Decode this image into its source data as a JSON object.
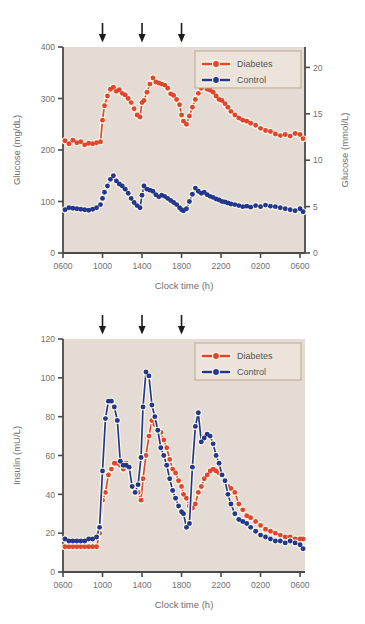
{
  "figure": {
    "panels": [
      "glucose",
      "insulin"
    ],
    "colors": {
      "diabetes": "#e0452f",
      "control": "#24378f",
      "plot_background": "#e4dcd4",
      "axis": "#4a4a48",
      "text": "#6f6f6f",
      "marker_halo": "#fbf7e6",
      "legend_background": "#ece4da",
      "legend_border": "#b9a88d",
      "arrow": "#1b1b1b"
    }
  },
  "chart_data": [
    {
      "type": "line",
      "id": "glucose",
      "title": "",
      "xlabel": "Clock time (h)",
      "ylabel": "Glucose (mg/dL)",
      "ylabel_right": "Glucose (mmol/L)",
      "xtick_labels": [
        "0600",
        "1000",
        "1400",
        "1800",
        "2200",
        "0200",
        "0600"
      ],
      "xticks": [
        6,
        10,
        14,
        18,
        22,
        26,
        30
      ],
      "xlim": [
        6,
        30.5
      ],
      "ylim": [
        0,
        400
      ],
      "yticks": [
        0,
        100,
        200,
        300,
        400
      ],
      "ytick_labels": [
        "0",
        "100",
        "200",
        "300",
        "400"
      ],
      "ylim_right": [
        0,
        22.2
      ],
      "yticks_right": [
        0,
        5,
        10,
        15,
        20
      ],
      "ytick_labels_right": [
        "0",
        "5",
        "10",
        "15",
        "20"
      ],
      "grid": false,
      "legend_position": "top-right",
      "annotations": [
        {
          "type": "arrow",
          "label": "meal",
          "x": 10.0
        },
        {
          "type": "arrow",
          "label": "meal",
          "x": 14.0
        },
        {
          "type": "arrow",
          "label": "meal",
          "x": 18.0
        }
      ],
      "series": [
        {
          "name": "Diabetes",
          "color": "#e0452f",
          "x": [
            6.2,
            6.6,
            7.0,
            7.4,
            7.8,
            8.2,
            8.6,
            9.0,
            9.4,
            9.8,
            10.0,
            10.2,
            10.5,
            10.8,
            11.1,
            11.4,
            11.7,
            12.0,
            12.3,
            12.6,
            12.9,
            13.2,
            13.5,
            13.8,
            14.0,
            14.2,
            14.5,
            14.8,
            15.1,
            15.4,
            15.7,
            16.0,
            16.3,
            16.6,
            16.9,
            17.2,
            17.5,
            17.8,
            18.0,
            18.2,
            18.5,
            18.8,
            19.1,
            19.4,
            19.7,
            20.0,
            20.3,
            20.6,
            20.9,
            21.2,
            21.5,
            21.8,
            22.1,
            22.4,
            22.7,
            23.0,
            23.4,
            23.8,
            24.2,
            24.6,
            25.0,
            25.5,
            26.0,
            26.5,
            27.0,
            27.5,
            28.0,
            28.5,
            29.0,
            29.5,
            30.0,
            30.3
          ],
          "y": [
            218,
            212,
            219,
            214,
            216,
            210,
            213,
            212,
            214,
            216,
            258,
            286,
            305,
            318,
            322,
            314,
            317,
            310,
            307,
            300,
            292,
            280,
            268,
            264,
            292,
            296,
            312,
            328,
            340,
            332,
            330,
            328,
            326,
            320,
            309,
            306,
            298,
            288,
            268,
            256,
            250,
            266,
            283,
            298,
            310,
            320,
            325,
            318,
            316,
            312,
            305,
            298,
            296,
            290,
            283,
            275,
            268,
            262,
            258,
            256,
            252,
            248,
            242,
            238,
            236,
            231,
            228,
            230,
            227,
            232,
            230,
            222
          ]
        },
        {
          "name": "Control",
          "color": "#24378f",
          "x": [
            6.2,
            6.6,
            7.0,
            7.4,
            7.8,
            8.2,
            8.6,
            9.0,
            9.4,
            9.8,
            10.0,
            10.2,
            10.5,
            10.8,
            11.1,
            11.4,
            11.7,
            12.0,
            12.3,
            12.6,
            12.9,
            13.2,
            13.5,
            13.8,
            14.0,
            14.2,
            14.5,
            14.8,
            15.1,
            15.4,
            15.7,
            16.0,
            16.3,
            16.6,
            16.9,
            17.2,
            17.5,
            17.8,
            18.0,
            18.2,
            18.5,
            18.8,
            19.1,
            19.4,
            19.7,
            20.0,
            20.3,
            20.6,
            20.9,
            21.2,
            21.5,
            21.8,
            22.1,
            22.4,
            22.7,
            23.0,
            23.4,
            23.8,
            24.2,
            24.6,
            25.0,
            25.5,
            26.0,
            26.5,
            27.0,
            27.5,
            28.0,
            28.5,
            29.0,
            29.5,
            30.0,
            30.3
          ],
          "y": [
            84,
            88,
            87,
            86,
            85,
            84,
            83,
            85,
            88,
            94,
            106,
            118,
            130,
            143,
            150,
            140,
            134,
            130,
            124,
            116,
            106,
            98,
            92,
            88,
            112,
            130,
            124,
            122,
            120,
            113,
            109,
            112,
            110,
            106,
            102,
            98,
            94,
            88,
            84,
            82,
            86,
            100,
            114,
            126,
            120,
            116,
            118,
            113,
            110,
            108,
            105,
            103,
            100,
            99,
            97,
            95,
            94,
            92,
            90,
            91,
            89,
            92,
            90,
            93,
            91,
            90,
            88,
            86,
            84,
            82,
            86,
            80
          ]
        }
      ]
    },
    {
      "type": "line",
      "id": "insulin",
      "title": "",
      "xlabel": "Clock time (h)",
      "ylabel": "Insulin (mU/L)",
      "xtick_labels": [
        "0600",
        "1000",
        "1400",
        "1800",
        "2200",
        "0200",
        "0600"
      ],
      "xticks": [
        6,
        10,
        14,
        18,
        22,
        26,
        30
      ],
      "xlim": [
        6,
        30.5
      ],
      "ylim": [
        0,
        120
      ],
      "yticks": [
        0,
        20,
        40,
        60,
        80,
        100,
        120
      ],
      "ytick_labels": [
        "0",
        "20",
        "40",
        "60",
        "80",
        "100",
        "120"
      ],
      "grid": false,
      "legend_position": "top-right",
      "annotations": [
        {
          "type": "arrow",
          "label": "meal",
          "x": 10.0
        },
        {
          "type": "arrow",
          "label": "meal",
          "x": 14.0
        },
        {
          "type": "arrow",
          "label": "meal",
          "x": 18.0
        }
      ],
      "series": [
        {
          "name": "Diabetes",
          "color": "#e0452f",
          "x": [
            6.2,
            6.6,
            7.0,
            7.4,
            7.8,
            8.2,
            8.6,
            9.0,
            9.4,
            9.7,
            10.0,
            10.3,
            10.6,
            10.9,
            11.2,
            11.5,
            11.8,
            12.1,
            12.4,
            12.7,
            13.0,
            13.3,
            13.6,
            13.9,
            14.1,
            14.4,
            14.7,
            15.0,
            15.3,
            15.6,
            15.9,
            16.2,
            16.5,
            16.8,
            17.1,
            17.4,
            17.7,
            18.0,
            18.2,
            18.5,
            18.8,
            19.1,
            19.4,
            19.7,
            20.0,
            20.3,
            20.6,
            20.9,
            21.2,
            21.5,
            21.8,
            22.1,
            22.4,
            22.7,
            23.0,
            23.4,
            23.8,
            24.2,
            24.6,
            25.0,
            25.5,
            26.0,
            26.5,
            27.0,
            27.5,
            28.0,
            28.5,
            29.0,
            29.5,
            30.0,
            30.3
          ],
          "y": [
            13,
            13,
            13,
            13,
            13,
            13,
            13,
            13,
            13,
            20,
            37,
            41,
            50,
            53,
            56,
            56,
            55,
            53,
            56,
            54,
            44,
            42,
            41,
            37,
            48,
            60,
            70,
            78,
            76,
            73,
            72,
            68,
            64,
            58,
            53,
            51,
            47,
            44,
            40,
            38,
            34,
            33,
            35,
            41,
            44,
            48,
            50,
            52,
            53,
            52,
            51,
            50,
            46,
            44,
            43,
            41,
            35,
            32,
            29,
            28,
            26,
            24,
            22,
            21,
            20,
            19,
            18,
            18,
            17,
            17,
            17
          ]
        },
        {
          "name": "Control",
          "color": "#24378f",
          "x": [
            6.2,
            6.6,
            7.0,
            7.4,
            7.8,
            8.2,
            8.6,
            9.0,
            9.4,
            9.7,
            10.0,
            10.3,
            10.6,
            10.9,
            11.2,
            11.5,
            11.8,
            12.1,
            12.4,
            12.7,
            13.0,
            13.3,
            13.6,
            13.9,
            14.1,
            14.4,
            14.7,
            15.0,
            15.3,
            15.6,
            15.9,
            16.2,
            16.5,
            16.8,
            17.1,
            17.4,
            17.7,
            18.0,
            18.2,
            18.5,
            18.8,
            19.1,
            19.4,
            19.7,
            20.0,
            20.3,
            20.6,
            20.9,
            21.2,
            21.5,
            21.8,
            22.1,
            22.4,
            22.7,
            23.0,
            23.4,
            23.8,
            24.2,
            24.6,
            25.0,
            25.5,
            26.0,
            26.5,
            27.0,
            27.5,
            28.0,
            28.5,
            29.0,
            29.5,
            30.0,
            30.3
          ],
          "y": [
            17,
            16,
            16,
            16,
            16,
            16,
            17,
            17,
            18,
            23,
            52,
            79,
            88,
            88,
            85,
            78,
            57,
            55,
            55,
            54,
            44,
            41,
            45,
            59,
            85,
            103,
            101,
            86,
            80,
            73,
            64,
            60,
            55,
            48,
            42,
            38,
            34,
            31,
            30,
            23,
            25,
            54,
            75,
            82,
            67,
            69,
            71,
            70,
            66,
            60,
            56,
            50,
            47,
            40,
            35,
            30,
            27,
            26,
            25,
            23,
            21,
            19,
            18,
            17,
            16,
            16,
            15,
            16,
            15,
            14,
            12
          ]
        }
      ]
    }
  ]
}
